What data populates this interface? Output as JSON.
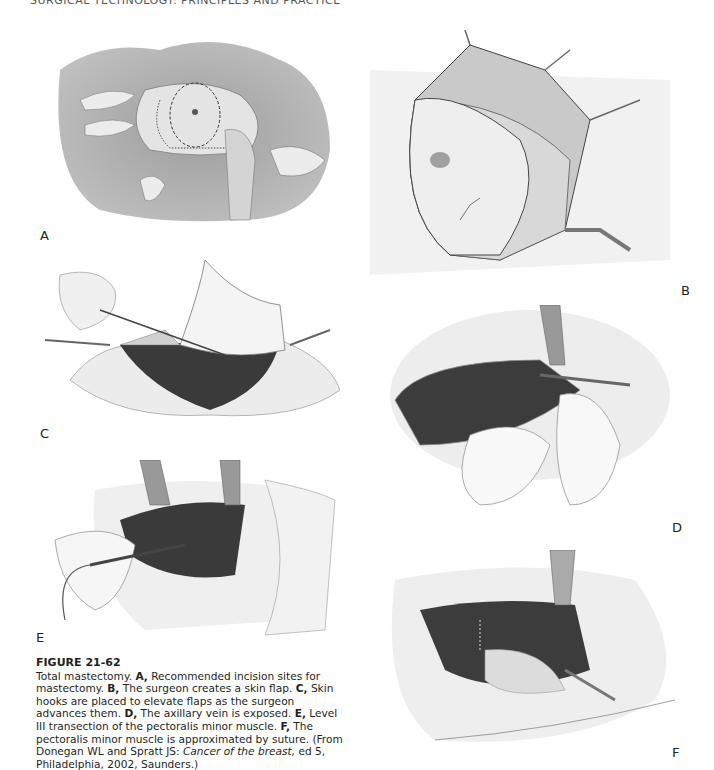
{
  "running_head": "SURGICAL TECHNOLOGY: PRINCIPLES AND PRACTICE",
  "panels": {
    "A": {
      "label": "A",
      "description": "Recommended incision sites for mastectomy"
    },
    "B": {
      "label": "B",
      "description": "Surgeon creates a skin flap"
    },
    "C": {
      "label": "C",
      "description": "Skin hooks elevate flaps"
    },
    "D": {
      "label": "D",
      "description": "Axillary vein exposed"
    },
    "E": {
      "label": "E",
      "description": "Level III transection of pectoralis minor"
    },
    "F": {
      "label": "F",
      "description": "Pectoralis minor approximated by suture"
    }
  },
  "caption": {
    "figure_number": "FIGURE 21-62",
    "intro": "Total mastectomy. ",
    "a_label": "A,",
    "a_text": " Recommended incision sites for mastectomy. ",
    "b_label": "B,",
    "b_text": " The surgeon creates a skin flap. ",
    "c_label": "C,",
    "c_text": " Skin hooks are placed to elevate flaps as the surgeon advances them. ",
    "d_label": "D,",
    "d_text": " The axillary vein is exposed. ",
    "e_label": "E,",
    "e_text": " Level III transection of the pectoralis minor muscle. ",
    "f_label": "F,",
    "f_text": " The pectoralis minor muscle is approximated by suture. (From Donegan WL and Spratt JS: ",
    "source_title": "Cancer of the breast,",
    "source_rest": " ed 5, Philadelphia, 2002, Saunders.)"
  },
  "colors": {
    "ink": "#231f20",
    "muscle": "#3a3a3a",
    "drape": "#9a9a9a",
    "skin": "#e6e6e6"
  }
}
